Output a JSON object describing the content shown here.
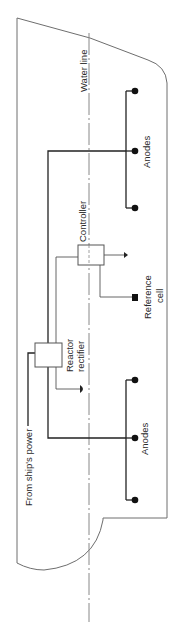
{
  "diagram": {
    "type": "ship-hull cathodic protection schematic",
    "orientation": "rotated 90 degrees (text reads bottom-to-top)",
    "labels": {
      "water_line": "Water line",
      "controller": "Controller",
      "reference_cell_line1": "Reference",
      "reference_cell_line2": "cell",
      "reactor_rectifier_line1": "Reactor",
      "reactor_rectifier_line2": "rectifier",
      "anodes_upper": "Anodes",
      "anodes_lower": "Anodes",
      "ships_power": "From ship's power"
    },
    "components": [
      {
        "id": "controller",
        "label": "Controller"
      },
      {
        "id": "reactor-rectifier",
        "label": "Reactor rectifier"
      },
      {
        "id": "reference-cell",
        "label": "Reference cell"
      },
      {
        "id": "anode-group-upper",
        "label": "Anodes",
        "count": 3
      },
      {
        "id": "anode-group-lower",
        "label": "Anodes",
        "count": 3
      }
    ],
    "colors": {
      "hull": "#6e6e6e",
      "wire": "#222222",
      "thin_wire": "#555555",
      "anode": "#111111",
      "water_line": "#888888"
    }
  }
}
